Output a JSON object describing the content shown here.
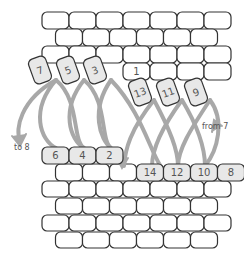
{
  "colors": {
    "brick_stroke": "#333333",
    "brick_fill": "#ffffff",
    "tile_fill": "#e8e8e8",
    "arrow": "#a8a8a8",
    "text": "#555555"
  },
  "top_tiles": [
    {
      "num": "7",
      "x": 40,
      "y": 70,
      "rot": -20
    },
    {
      "num": "5",
      "x": 68,
      "y": 70,
      "rot": -20
    },
    {
      "num": "3",
      "x": 95,
      "y": 70,
      "rot": -20
    },
    {
      "num": "13",
      "x": 140,
      "y": 92,
      "rot": -20
    },
    {
      "num": "11",
      "x": 168,
      "y": 92,
      "rot": -20
    },
    {
      "num": "9",
      "x": 196,
      "y": 92,
      "rot": -20
    }
  ],
  "row_one": {
    "num": "1"
  },
  "bottom_left_tiles": [
    "6",
    "4",
    "2"
  ],
  "bottom_right_tiles": [
    "14",
    "12",
    "10",
    "8"
  ],
  "labels": {
    "to": "to 8",
    "from": "from 7"
  }
}
